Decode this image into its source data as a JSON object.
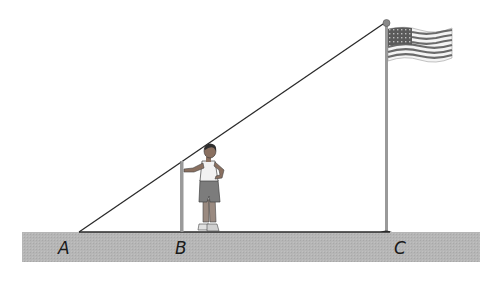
{
  "diagram": {
    "type": "similar-triangles-shadow",
    "points": {
      "A": {
        "label": "A",
        "x": 79,
        "y": 232
      },
      "B": {
        "label": "B",
        "x": 182,
        "y": 232
      },
      "C": {
        "label": "C",
        "x": 386,
        "y": 232
      }
    },
    "labels": {
      "a": "A",
      "b": "B",
      "c": "C"
    },
    "objects": {
      "ground": "ground-strip",
      "boy": "boy-standing-at-B",
      "pole_b": "short-pole-at-B",
      "flagpole": "flagpole-at-C",
      "flag": "american-flag",
      "sight_line": "line-from-A-to-flagpole-top"
    },
    "colors": {
      "ground": "#b4b4b4",
      "line": "#2a2a2a",
      "pole": "#9a9a9a",
      "label": "#1a1a1a"
    }
  }
}
